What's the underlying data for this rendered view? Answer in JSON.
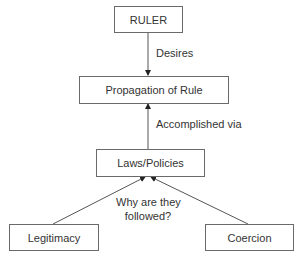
{
  "nodes": {
    "ruler": "RULER",
    "propagation": "Propagation of Rule",
    "laws": "Laws/Policies",
    "legitimacy": "Legitimacy",
    "coercion": "Coercion"
  },
  "edges": {
    "desires": "Desires",
    "accomplished": "Accomplished via",
    "why_line1": "Why are they",
    "why_line2": "followed?"
  },
  "colors": {
    "line": "#555555",
    "border": "#6a6a6a",
    "text": "#333333"
  }
}
